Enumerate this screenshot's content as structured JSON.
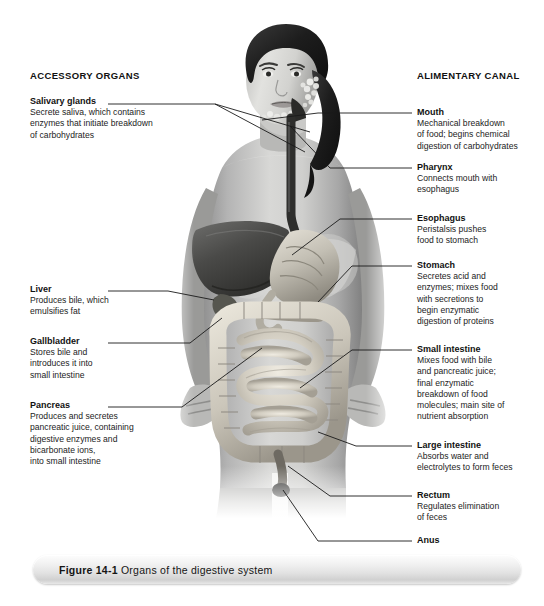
{
  "figure": {
    "caption_number": "Figure 14-1",
    "caption_title": "Organs of the digestive system",
    "alt": "Grayscale photograph of a female torso overlaid with an illustration of the digestive organs"
  },
  "columns": {
    "left_header": "ACCESSORY ORGANS",
    "right_header": "ALIMENTARY CANAL"
  },
  "accessory_organs": [
    {
      "term": "Salivary glands",
      "lines": [
        "Secrete saliva, which contains",
        "enzymes that initiate breakdown",
        "of carbohydrates"
      ]
    },
    {
      "term": "Liver",
      "lines": [
        "Produces bile, which",
        "emulsifies fat"
      ]
    },
    {
      "term": "Gallbladder",
      "lines": [
        "Stores bile and",
        "introduces it into",
        "small intestine"
      ]
    },
    {
      "term": "Pancreas",
      "lines": [
        "Produces and secretes",
        "pancreatic juice, containing",
        "digestive enzymes and",
        "bicarbonate ions,",
        "into small intestine"
      ]
    }
  ],
  "alimentary_canal": [
    {
      "term": "Mouth",
      "lines": [
        "Mechanical breakdown",
        "of food; begins chemical",
        "digestion of carbohydrates"
      ]
    },
    {
      "term": "Pharynx",
      "lines": [
        "Connects mouth with",
        "esophagus"
      ]
    },
    {
      "term": "Esophagus",
      "lines": [
        "Peristalsis pushes",
        "food to stomach"
      ]
    },
    {
      "term": "Stomach",
      "lines": [
        "Secretes acid and",
        "enzymes; mixes food",
        "with secretions to",
        "begin enzymatic",
        "digestion of proteins"
      ]
    },
    {
      "term": "Small intestine",
      "lines": [
        "Mixes food with bile",
        "and pancreatic juice;",
        "final enzymatic",
        "breakdown of food",
        "molecules; main site of",
        "nutrient absorption"
      ]
    },
    {
      "term": "Large intestine",
      "lines": [
        "Absorbs water and",
        "electrolytes to form feces"
      ]
    },
    {
      "term": "Rectum",
      "lines": [
        "Regulates elimination",
        "of feces"
      ]
    },
    {
      "term": "Anus",
      "lines": []
    }
  ],
  "colors": {
    "text": "#111111",
    "leader_line": "#1a1a1a",
    "background": "#ffffff",
    "caption_bar_light": "#fdfdfd",
    "caption_bar_dark": "#d0d0d0"
  }
}
